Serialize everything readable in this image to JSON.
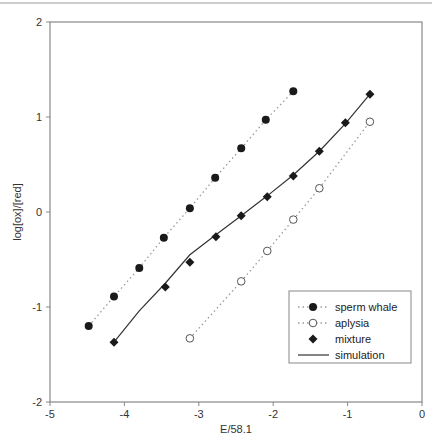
{
  "chart_data": {
    "type": "scatter",
    "title": "",
    "xlabel": "E/58.1",
    "ylabel": "log[ox]/[red]",
    "xlim": [
      -5,
      0
    ],
    "ylim": [
      -2,
      2
    ],
    "xticks": [
      -5,
      -4,
      -3,
      -2,
      -1,
      0
    ],
    "yticks": [
      -2,
      -1,
      0,
      1,
      2
    ],
    "grid": false,
    "legend_position": "lower right",
    "series": [
      {
        "name": "sperm whale",
        "marker": "filled-circle",
        "line": "dotted",
        "x": [
          -4.48,
          -4.14,
          -3.8,
          -3.47,
          -3.12,
          -2.78,
          -2.43,
          -2.1,
          -1.73
        ],
        "y": [
          -1.2,
          -0.89,
          -0.59,
          -0.27,
          0.04,
          0.36,
          0.67,
          0.97,
          1.27
        ]
      },
      {
        "name": "aplysia",
        "marker": "open-circle",
        "line": "dotted",
        "x": [
          -3.12,
          -2.43,
          -2.08,
          -1.73,
          -1.38,
          -0.7
        ],
        "y": [
          -1.33,
          -0.73,
          -0.41,
          -0.08,
          0.25,
          0.95
        ]
      },
      {
        "name": "mixture",
        "marker": "filled-diamond",
        "line": "none",
        "x": [
          -4.14,
          -3.45,
          -3.12,
          -2.77,
          -2.43,
          -2.08,
          -1.73,
          -1.38,
          -1.03,
          -0.7
        ],
        "y": [
          -1.37,
          -0.79,
          -0.53,
          -0.26,
          -0.04,
          0.16,
          0.38,
          0.64,
          0.94,
          1.24
        ]
      },
      {
        "name": "simulation",
        "marker": "none",
        "line": "solid",
        "x": [
          -4.14,
          -3.8,
          -3.45,
          -3.12,
          -2.77,
          -2.43,
          -2.08,
          -1.73,
          -1.38,
          -1.03,
          -0.7
        ],
        "y": [
          -1.37,
          -1.04,
          -0.75,
          -0.45,
          -0.24,
          -0.04,
          0.17,
          0.39,
          0.64,
          0.93,
          1.24
        ]
      }
    ]
  },
  "legend": {
    "items": [
      "sperm whale",
      "aplysia",
      "mixture",
      "simulation"
    ]
  },
  "colors": {
    "axis": "#888888",
    "marker": "#1a1a1a",
    "dotted": "#9a9a9a",
    "simulation": "#333333"
  }
}
